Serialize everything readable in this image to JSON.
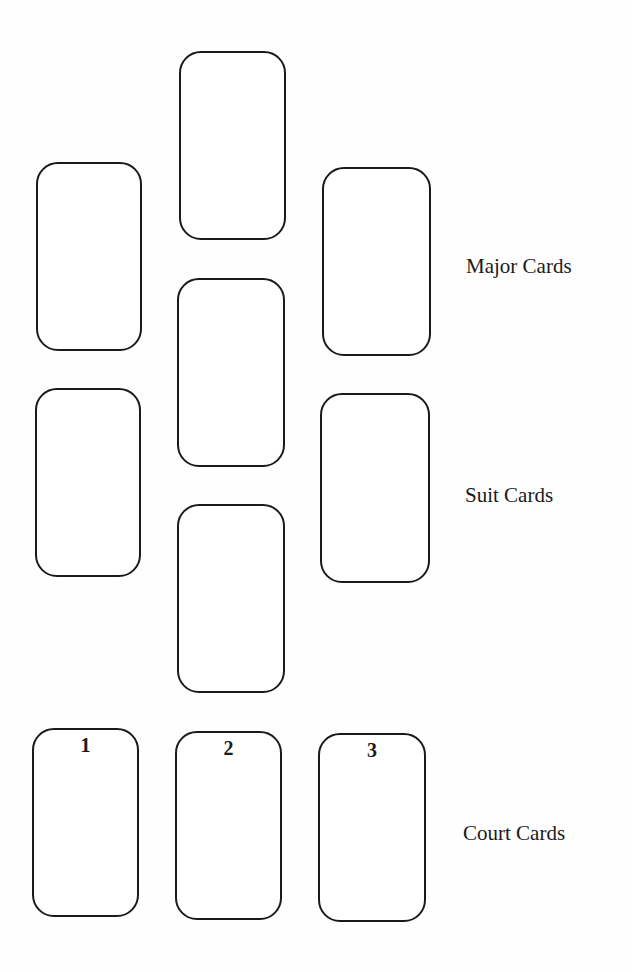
{
  "diagram": {
    "type": "tarot-spread-layout",
    "cards": [
      {
        "id": "major-top-center",
        "group": "Major Cards",
        "number": ""
      },
      {
        "id": "major-left",
        "group": "Major Cards",
        "number": ""
      },
      {
        "id": "major-right",
        "group": "Major Cards",
        "number": ""
      },
      {
        "id": "center-middle",
        "group": "Major Cards",
        "number": ""
      },
      {
        "id": "suit-left",
        "group": "Suit Cards",
        "number": ""
      },
      {
        "id": "suit-right",
        "group": "Suit Cards",
        "number": ""
      },
      {
        "id": "suit-center-bottom",
        "group": "Suit Cards",
        "number": ""
      },
      {
        "id": "court-1",
        "group": "Court Cards",
        "number": "1"
      },
      {
        "id": "court-2",
        "group": "Court Cards",
        "number": "2"
      },
      {
        "id": "court-3",
        "group": "Court Cards",
        "number": "3"
      }
    ],
    "labels": {
      "major": "Major Cards",
      "suit": "Suit Cards",
      "court": "Court Cards"
    }
  }
}
